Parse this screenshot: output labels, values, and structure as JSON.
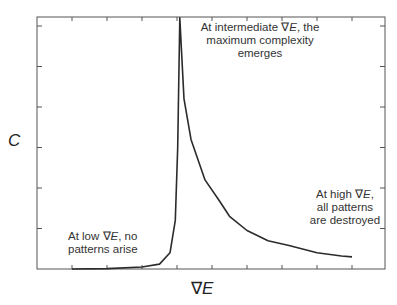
{
  "chart_data": {
    "type": "line",
    "title": "",
    "xlabel": "∇E",
    "ylabel": "C",
    "grid": false,
    "legend": null,
    "x_ticks_labeled": false,
    "y_ticks_labeled": false,
    "xlim": [
      0,
      9
    ],
    "ylim": [
      0,
      6
    ],
    "series": [
      {
        "name": "complexity",
        "x": [
          1.0,
          2.0,
          3.0,
          3.5,
          3.8,
          3.95,
          4.02,
          4.08,
          4.2,
          4.4,
          4.8,
          5.2,
          5.5,
          6.0,
          6.6,
          7.2,
          8.0,
          8.7,
          9.0
        ],
        "y": [
          0.0,
          0.01,
          0.05,
          0.12,
          0.4,
          1.2,
          3.0,
          6.2,
          4.2,
          3.2,
          2.2,
          1.7,
          1.3,
          0.95,
          0.7,
          0.58,
          0.4,
          0.32,
          0.3
        ]
      }
    ],
    "annotations": [
      {
        "id": "low",
        "text": "At low ∇E, no patterns arise"
      },
      {
        "id": "mid",
        "text": "At intermediate ∇E, the maximum complexity emerges"
      },
      {
        "id": "high",
        "text": "At high ∇E, all patterns are destroyed"
      }
    ]
  },
  "labels": {
    "x_axis": "∇E",
    "y_axis": "C"
  },
  "annotations": {
    "mid": {
      "l1a": "At intermediate ∇",
      "l1b": "E",
      "l1c": ", the",
      "l2": "maximum complexity",
      "l3": "emerges"
    },
    "high": {
      "l1a": "At high ∇",
      "l1b": "E",
      "l1c": ",",
      "l2": "all patterns",
      "l3": "are destroyed"
    },
    "low": {
      "l1a": "At low ∇",
      "l1b": "E",
      "l1c": ", no",
      "l2": "patterns arise"
    }
  },
  "colors": {
    "curve": "#2b2b2b",
    "axes": "#555555",
    "background": "#ffffff"
  }
}
